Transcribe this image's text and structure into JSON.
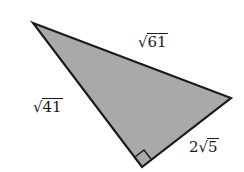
{
  "diagram": {
    "type": "right-triangle",
    "fill_color": "#a9a9a9",
    "stroke_color": "#1a1a1a",
    "vertices": {
      "top_left": [
        33,
        23
      ],
      "right": [
        231,
        98
      ],
      "bottom": [
        142,
        167
      ]
    },
    "right_angle_at": "bottom",
    "sides": {
      "hypotenuse": {
        "coef": "",
        "radicand": "61",
        "text": "√61"
      },
      "left_leg": {
        "coef": "",
        "radicand": "41",
        "text": "√41"
      },
      "right_leg": {
        "coef": "2",
        "radicand": "5",
        "text": "2√5"
      }
    }
  }
}
